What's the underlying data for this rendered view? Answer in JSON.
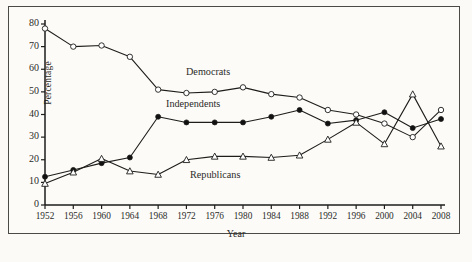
{
  "chart_data": {
    "type": "line",
    "title": "",
    "xlabel": "Year",
    "ylabel": "Percentage",
    "xlim": [
      1950,
      2010
    ],
    "ylim": [
      0,
      80
    ],
    "yticks": [
      0,
      10,
      20,
      30,
      40,
      50,
      60,
      70,
      80
    ],
    "grid": false,
    "legend_position": "inline-annotations",
    "categories": [
      1952,
      1956,
      1960,
      1964,
      1968,
      1972,
      1976,
      1980,
      1984,
      1988,
      1992,
      1996,
      2000,
      2004,
      2008
    ],
    "x": [
      "1952",
      "1956",
      "1960",
      "1964",
      "1968",
      "1972",
      "1976",
      "1980",
      "1984",
      "1988",
      "1992",
      "1996",
      "2000",
      "2004",
      "2008"
    ],
    "series": [
      {
        "name": "Democrats",
        "marker": "open-circle",
        "values": [
          78,
          70,
          70.5,
          65.5,
          51,
          49.5,
          50,
          52,
          49,
          47.5,
          42,
          40,
          36,
          30,
          42
        ]
      },
      {
        "name": "Independents",
        "marker": "filled-circle",
        "values": [
          12.5,
          15.5,
          18.5,
          21,
          39,
          36.5,
          36.5,
          36.5,
          39,
          42,
          36,
          37.5,
          41,
          34,
          38
        ]
      },
      {
        "name": "Republicans",
        "marker": "open-triangle",
        "values": [
          9.5,
          14.5,
          20.5,
          15,
          13.5,
          20,
          21.5,
          21.5,
          21,
          22,
          29,
          36.5,
          27,
          49,
          26
        ]
      }
    ]
  },
  "axes": {
    "y_title": "Percentage",
    "x_title": "Year",
    "y_ticks": [
      "0",
      "10",
      "20",
      "30",
      "40",
      "50",
      "60",
      "70",
      "80"
    ],
    "x_ticks": [
      "1952",
      "1956",
      "1960",
      "1964",
      "1968",
      "1972",
      "1976",
      "1980",
      "1984",
      "1988",
      "1992",
      "1996",
      "2000",
      "2004",
      "2008"
    ]
  },
  "annotations": {
    "democrats": "Democrats",
    "independents": "Independents",
    "republicans": "Republicans"
  },
  "colors": {
    "ink": "#2b2b28",
    "line": "#1d1d1b",
    "background": "#fbfaf7",
    "marker_fill_open": "#ffffff",
    "marker_fill_solid": "#111111"
  }
}
